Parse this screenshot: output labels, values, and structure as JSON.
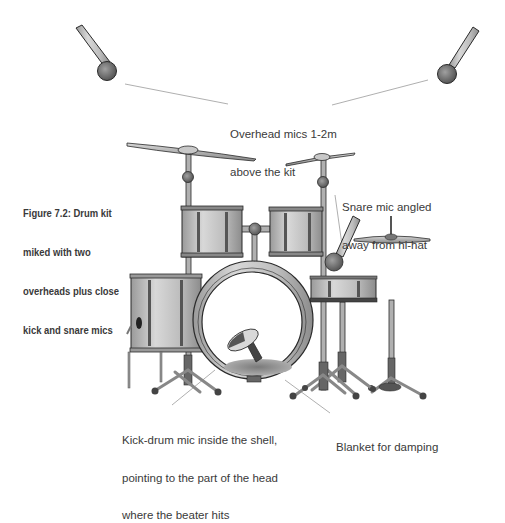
{
  "figure": {
    "caption_lines": [
      "Figure 7.2: Drum kit",
      "miked with two",
      "overheads plus close",
      "kick and snare mics"
    ]
  },
  "annotations": {
    "overhead": {
      "lines": [
        "Overhead mics 1-2m",
        "above the kit"
      ]
    },
    "snare": {
      "lines": [
        "Snare mic angled",
        "away from hi-hat"
      ]
    },
    "kick": {
      "lines": [
        "Kick-drum mic inside the shell,",
        "pointing to the part of the head",
        "where the beater hits"
      ]
    },
    "blanket": {
      "lines": [
        "Blanket for damping"
      ]
    }
  },
  "colors": {
    "outline": "#2a2a2a",
    "metal_light": "#cfcfcf",
    "metal_mid": "#a8a8a8",
    "metal_dark": "#6e6e6e",
    "mic_head": "#7a7a7a",
    "leader_line": "#9a9a9a",
    "text": "#3a3a3a"
  }
}
